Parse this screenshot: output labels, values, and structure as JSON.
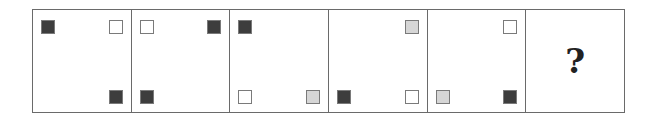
{
  "colors": {
    "dark": "#3d3d3d",
    "light": "#d6d6d6",
    "white": "#ffffff",
    "border": "#6a6a6a"
  },
  "panels": [
    {
      "tl": "dark",
      "tr": "white",
      "bl": null,
      "br": "dark"
    },
    {
      "tl": "white",
      "tr": "dark",
      "bl": "dark",
      "br": null
    },
    {
      "tl": "dark",
      "tr": null,
      "bl": "white",
      "br": "light"
    },
    {
      "tl": null,
      "tr": "light",
      "bl": "dark",
      "br": "white"
    },
    {
      "tl": null,
      "tr": "white",
      "bl": "light",
      "br": "dark"
    }
  ],
  "answer_panel": {
    "label": "?"
  }
}
